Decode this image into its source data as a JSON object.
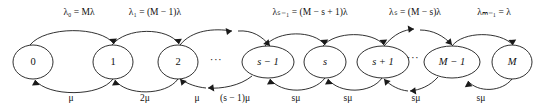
{
  "diagram": {
    "type": "state-transition-diagram",
    "stroke_color": "#1a1a1a",
    "text_color": "#111111",
    "background_color": "#ffffff",
    "states": [
      {
        "id": "s0",
        "label": "0",
        "cx": 33,
        "cy": 62,
        "rx": 20,
        "ry": 17,
        "italic": false
      },
      {
        "id": "s1",
        "label": "1",
        "cx": 113,
        "cy": 62,
        "rx": 20,
        "ry": 17,
        "italic": false
      },
      {
        "id": "s2",
        "label": "2",
        "cx": 178,
        "cy": 62,
        "rx": 20,
        "ry": 17,
        "italic": false
      },
      {
        "id": "ssm1",
        "label": "s − 1",
        "cx": 268,
        "cy": 62,
        "rx": 26,
        "ry": 16,
        "italic": true
      },
      {
        "id": "ss",
        "label": "s",
        "cx": 325,
        "cy": 62,
        "rx": 21,
        "ry": 16,
        "italic": true
      },
      {
        "id": "ssp1",
        "label": "s + 1",
        "cx": 383,
        "cy": 62,
        "rx": 26,
        "ry": 16,
        "italic": true
      },
      {
        "id": "sMm1",
        "label": "M − 1",
        "cx": 452,
        "cy": 62,
        "rx": 28,
        "ry": 16,
        "italic": true
      },
      {
        "id": "sM",
        "label": "M",
        "cx": 512,
        "cy": 62,
        "rx": 20,
        "ry": 17,
        "italic": true
      }
    ],
    "ellipses": [
      {
        "id": "gap1",
        "label": "···",
        "x": 216,
        "y": 60
      },
      {
        "id": "gap2",
        "label": "···",
        "x": 413,
        "y": 58
      }
    ],
    "birth_rates": [
      {
        "id": "lambda0",
        "label": "λ₀ = Mλ",
        "x": 79,
        "y": 13
      },
      {
        "id": "lambda1",
        "label": "λ₁ = (M − 1)λ",
        "x": 155,
        "y": 13
      },
      {
        "id": "lambdasm1",
        "label": "λₛ₋₁ = (M − s + 1)λ",
        "x": 310,
        "y": 13
      },
      {
        "id": "lambdas",
        "label": "λₛ = (M − s)λ",
        "x": 415,
        "y": 13
      },
      {
        "id": "lambdaMm1",
        "label": "λₘ₋₁ = λ",
        "x": 494,
        "y": 13
      }
    ],
    "death_rates": [
      {
        "id": "mu1",
        "label": "μ",
        "x": 71,
        "y": 99
      },
      {
        "id": "mu2",
        "label": "2μ",
        "x": 145,
        "y": 99
      },
      {
        "id": "mu3",
        "label": "μ",
        "x": 197,
        "y": 99
      },
      {
        "id": "mu4",
        "label": "(s − 1)μ",
        "x": 235,
        "y": 99
      },
      {
        "id": "mu5",
        "label": "sμ",
        "x": 296,
        "y": 99
      },
      {
        "id": "mu6",
        "label": "sμ",
        "x": 348,
        "y": 99
      },
      {
        "id": "mu7",
        "label": "sμ",
        "x": 416,
        "y": 99
      },
      {
        "id": "mu8",
        "label": "sμ",
        "x": 481,
        "y": 99
      }
    ],
    "forward_arcs": [
      {
        "id": "f0",
        "from": "s0",
        "to": "s1",
        "d": "M 30,45 C 45,26 101,26 114,44",
        "head": "M 114,44 L 109.2,39.1 L 117.0,38.4 Z"
      },
      {
        "id": "f1",
        "from": "s1",
        "to": "s2",
        "d": "M 112,45 C 126,27 168,27 179,44",
        "head": "M 179,44 L 174.0,39.3 L 181.9,38.8 Z"
      },
      {
        "id": "f2",
        "from": "s2",
        "to": "gap1",
        "d": "M 180,45 C 192,30 214,28 232,31",
        "head": "M 232,31 L 225.6,27.9 L 227.0,35.0 Z"
      },
      {
        "id": "f3",
        "from": "gap1",
        "to": "ssm1",
        "d": "M 238,31 C 252,30 262,36 270,46",
        "head": "M 270,46 L 268.6,39.2 L 263.2,44.0 Z"
      },
      {
        "id": "f4",
        "from": "ssm1",
        "to": "ss",
        "d": "M 265,46 C 278,30 314,30 325,45",
        "head": "M 325,45 L 320.3,40.0 L 328.2,39.6 Z"
      },
      {
        "id": "f5",
        "from": "ss",
        "to": "ssp1",
        "d": "M 323,46 C 335,31 372,31 384,45",
        "head": "M 384,45 L 379.3,40.0 L 387.2,39.6 Z"
      },
      {
        "id": "f6",
        "from": "ssp1",
        "to": "gap2",
        "d": "M 384,46 C 395,33 404,30 414,29",
        "head": "M 414,29 L 407.7,25.6 L 408.8,32.8 Z"
      },
      {
        "id": "f7",
        "from": "gap2",
        "to": "sMm1",
        "d": "M 420,30 C 433,30 444,36 452,45",
        "head": "M 452,45 L 450.7,38.2 L 445.2,43.0 Z"
      },
      {
        "id": "f8",
        "from": "sMm1",
        "to": "sM",
        "d": "M 452,46 C 463,31 500,31 513,45",
        "head": "M 513,45 L 508.3,40.0 L 516.2,39.6 Z"
      }
    ],
    "backward_arcs": [
      {
        "id": "b0",
        "from": "s1",
        "to": "s0",
        "d": "M 113,79 C 100,97 48,97 35,80",
        "head": "M 35,80 L 39.8,84.9 L 32.0,85.6 Z"
      },
      {
        "id": "b1",
        "from": "s2",
        "to": "s1",
        "d": "M 178,79 C 166,96 126,96 115,80",
        "head": "M 115,80 L 119.8,84.9 L 112.0,85.6 Z"
      },
      {
        "id": "b2",
        "from": "ssm1",
        "to": "gap1",
        "d": "M 252,76 C 240,86 221,89 208,88",
        "head": "M 208,88 L 214.3,91.4 L 213.2,84.2 Z"
      },
      {
        "id": "b3",
        "from": "gap1",
        "to": "s2",
        "d": "M 206,88 C 196,87 188,84 180,79",
        "head": "M 180,79 L 181.5,85.8 L 186.8,80.9 Z"
      },
      {
        "id": "b4",
        "from": "ss",
        "to": "ssm1",
        "d": "M 325,78 C 313,94 281,94 270,79",
        "head": "M 270,79 L 274.8,83.9 L 267.0,84.6 Z"
      },
      {
        "id": "b5",
        "from": "ssp1",
        "to": "ss",
        "d": "M 382,78 C 371,94 339,94 328,79",
        "head": "M 328,79 L 332.8,83.9 L 325.0,84.6 Z"
      },
      {
        "id": "b6",
        "from": "sMm1",
        "to": "gap2",
        "d": "M 438,77 C 430,86 420,90 410,91",
        "head": "M 410,91 L 416.3,94.4 L 415.2,87.2 Z"
      },
      {
        "id": "b7",
        "from": "gap2",
        "to": "ssp1",
        "d": "M 408,91 C 399,90 391,86 384,79",
        "head": "M 384,79 L 385.2,85.8 L 390.6,81.1 Z"
      },
      {
        "id": "b8",
        "from": "sM",
        "to": "sMm1",
        "d": "M 512,79 C 502,92 478,93 468,81",
        "head": "M 468,81 L 472.4,86.2 L 464.8,87.2 Z"
      }
    ]
  }
}
